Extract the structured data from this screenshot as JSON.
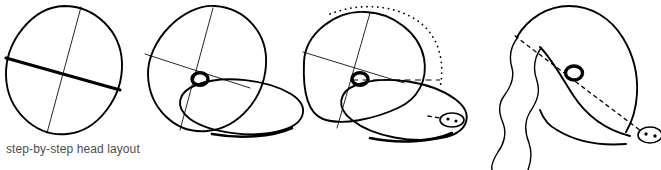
{
  "figure": {
    "caption": "step-by-step head layout",
    "background_color": "#ffffff",
    "ink_color": "#000000",
    "caption_color": "#4d4d4d",
    "width": 661,
    "height": 170,
    "steps": [
      {
        "index": 1,
        "name": "step-1-cranium-circle",
        "label": "circle with cross axes",
        "elements": [
          "cranium-circle",
          "horizontal-axis-heavy",
          "vertical-axis-light"
        ]
      },
      {
        "index": 2,
        "name": "step-2-muzzle-block-in",
        "label": "circle plus muzzle ellipse and eye",
        "elements": [
          "cranium-circle",
          "horizontal-axis-light",
          "vertical-axis-light",
          "muzzle-ellipse",
          "eye-ring"
        ]
      },
      {
        "index": 3,
        "name": "step-3-skull-contour",
        "label": "skull contour with dotted arc, dashed level line and nose",
        "elements": [
          "skull-contour",
          "dotted-arc",
          "dashed-level-line",
          "muzzle-ellipse",
          "eye-ring",
          "nose-ring",
          "nostrils"
        ]
      },
      {
        "index": 4,
        "name": "step-4-finished-head",
        "label": "finished head with ear and eye-to-nose guideline",
        "elements": [
          "head-outline",
          "ear-outline",
          "eye-ring",
          "nose",
          "dashed-guideline"
        ]
      }
    ]
  }
}
